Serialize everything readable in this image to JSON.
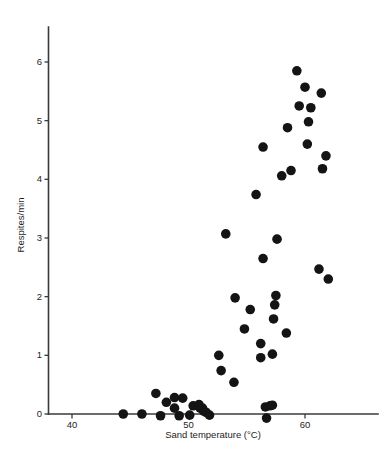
{
  "chart_data": {
    "type": "scatter",
    "title": "",
    "xlabel": "Sand temperature (°C)",
    "ylabel": "Respites/min",
    "xlim": [
      37.5,
      65.5
    ],
    "ylim": [
      -0.15,
      6.6
    ],
    "xticks": [
      40,
      50,
      60
    ],
    "yticks": [
      0,
      1,
      2,
      3,
      4,
      5,
      6
    ],
    "xtick_labels": [
      "40",
      "50",
      "60"
    ],
    "ytick_labels": [
      "0",
      "1",
      "2",
      "3",
      "4",
      "5",
      "6"
    ],
    "grid": false,
    "legend": null,
    "marker": "filled-circle",
    "marker_color": "#141414",
    "marker_size": 5.6,
    "points": [
      {
        "x": 44.4,
        "y": 0.0
      },
      {
        "x": 46.0,
        "y": 0.0
      },
      {
        "x": 47.2,
        "y": 0.35
      },
      {
        "x": 47.6,
        "y": -0.03
      },
      {
        "x": 48.1,
        "y": 0.2
      },
      {
        "x": 48.8,
        "y": 0.28
      },
      {
        "x": 48.8,
        "y": 0.1
      },
      {
        "x": 49.2,
        "y": -0.03
      },
      {
        "x": 49.5,
        "y": 0.27
      },
      {
        "x": 50.1,
        "y": -0.02
      },
      {
        "x": 50.4,
        "y": 0.14
      },
      {
        "x": 50.9,
        "y": 0.16
      },
      {
        "x": 51.0,
        "y": 0.1
      },
      {
        "x": 51.2,
        "y": 0.1
      },
      {
        "x": 51.3,
        "y": 0.05
      },
      {
        "x": 51.5,
        "y": 0.03
      },
      {
        "x": 51.8,
        "y": -0.02
      },
      {
        "x": 52.6,
        "y": 1.0
      },
      {
        "x": 52.8,
        "y": 0.74
      },
      {
        "x": 53.2,
        "y": 3.07
      },
      {
        "x": 53.9,
        "y": 0.54
      },
      {
        "x": 54.0,
        "y": 1.98
      },
      {
        "x": 54.8,
        "y": 1.45
      },
      {
        "x": 55.3,
        "y": 1.78
      },
      {
        "x": 55.8,
        "y": 3.74
      },
      {
        "x": 56.2,
        "y": 1.2
      },
      {
        "x": 56.2,
        "y": 0.96
      },
      {
        "x": 56.4,
        "y": 2.65
      },
      {
        "x": 56.4,
        "y": 4.55
      },
      {
        "x": 56.6,
        "y": 0.12
      },
      {
        "x": 56.7,
        "y": -0.07
      },
      {
        "x": 57.0,
        "y": 0.14
      },
      {
        "x": 57.2,
        "y": 0.15
      },
      {
        "x": 57.2,
        "y": 1.02
      },
      {
        "x": 57.3,
        "y": 1.62
      },
      {
        "x": 57.4,
        "y": 1.86
      },
      {
        "x": 57.5,
        "y": 2.02
      },
      {
        "x": 57.6,
        "y": 2.98
      },
      {
        "x": 58.0,
        "y": 4.06
      },
      {
        "x": 58.4,
        "y": 1.38
      },
      {
        "x": 58.5,
        "y": 4.88
      },
      {
        "x": 58.8,
        "y": 4.15
      },
      {
        "x": 59.3,
        "y": 5.85
      },
      {
        "x": 59.5,
        "y": 5.25
      },
      {
        "x": 60.0,
        "y": 5.57
      },
      {
        "x": 60.2,
        "y": 4.6
      },
      {
        "x": 60.3,
        "y": 4.98
      },
      {
        "x": 60.5,
        "y": 5.22
      },
      {
        "x": 61.2,
        "y": 2.47
      },
      {
        "x": 61.4,
        "y": 5.47
      },
      {
        "x": 61.5,
        "y": 4.18
      },
      {
        "x": 61.8,
        "y": 4.4
      },
      {
        "x": 62.0,
        "y": 2.3
      }
    ]
  }
}
